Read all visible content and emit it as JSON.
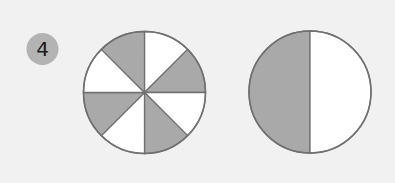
{
  "question": {
    "number": "4",
    "badge_color": "#b3b3b3"
  },
  "colors": {
    "background": "#f1f1f1",
    "shaded": "#a9a9a9",
    "unshaded": "#ffffff",
    "stroke": "#707070"
  },
  "figures": [
    {
      "name": "circle-eighths",
      "divisions": 8,
      "shaded_parts": 4,
      "shaded_indices": [
        1,
        3,
        5,
        7
      ],
      "description": "Circle divided into 8 equal sectors, alternating shaded"
    },
    {
      "name": "circle-halves",
      "divisions": 2,
      "shaded_parts": 1,
      "description": "Circle divided into 2 halves, left half shaded"
    }
  ]
}
